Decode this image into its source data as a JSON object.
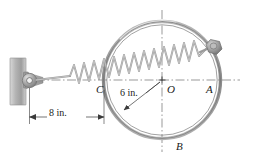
{
  "figure": {
    "type": "mechanics-free-body-diagram",
    "labels": {
      "point_A": "A",
      "point_B": "B",
      "point_C": "C",
      "center_O": "O"
    },
    "dimensions": {
      "radius": "6 in.",
      "wall_offset": "8 in."
    },
    "colors": {
      "ring": "#8c8c8c",
      "ring_highlight": "#c9c9c9",
      "spring": "#9a9a9a",
      "wall": "#b0b0b0",
      "centerline": "#6f6f6f",
      "dimension": "#3a3a3a",
      "text": "#1a1a1a",
      "collar": "#8f8f8f"
    },
    "geometry": {
      "circle_center_x": 162,
      "circle_center_y": 80,
      "circle_radius": 58,
      "collar_x": 215,
      "collar_y": 46,
      "pin_x": 26,
      "pin_y": 80,
      "wall_x": 10,
      "wall_top": 58,
      "wall_bottom": 104
    }
  }
}
